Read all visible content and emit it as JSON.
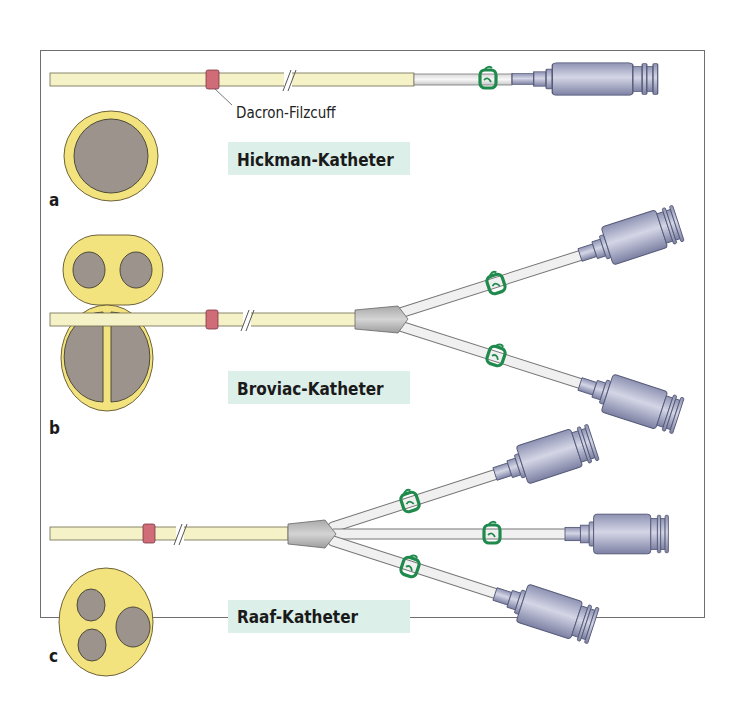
{
  "figure": {
    "panels": [
      {
        "letter": "a",
        "name": "Hickman-Katheter",
        "lumens": 1,
        "cuff_label": "Dacron-Filzcuff"
      },
      {
        "letter": "b",
        "name": "Broviac-Katheter",
        "lumens": 2
      },
      {
        "letter": "c",
        "name": "Raaf-Katheter",
        "lumens": 3
      }
    ],
    "colors": {
      "catheter": "#f6f2c8",
      "lumen_wall": "#f2e37e",
      "lumen": "#9c948c",
      "cuff": "#d06b78",
      "clamp": "#1f8a4c",
      "connector": "#a9acc6",
      "hub": "#bfbfbf",
      "label_bg": "#dcefe9"
    }
  }
}
